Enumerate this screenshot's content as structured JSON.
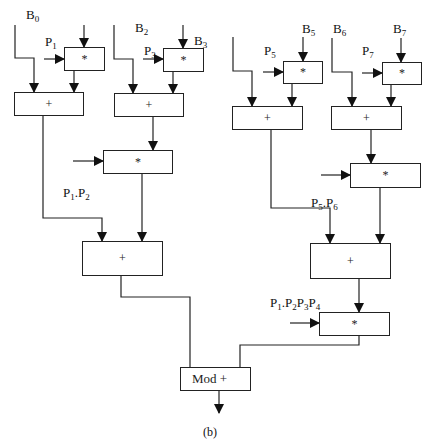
{
  "diagram": {
    "caption": "(b)",
    "operators": {
      "mul": "*",
      "add": "+",
      "mod_add": "Mod +"
    },
    "inputs": {
      "b0": {
        "base": "B",
        "sub": "0"
      },
      "b2": {
        "base": "B",
        "sub": "2"
      },
      "b3": {
        "base": "B",
        "sub": "3"
      },
      "b5": {
        "base": "B",
        "sub": "5"
      },
      "b6": {
        "base": "B",
        "sub": "6"
      },
      "b7": {
        "base": "B",
        "sub": "7"
      },
      "p1": {
        "base": "P",
        "sub": "1"
      },
      "p3": {
        "base": "P",
        "sub": "3"
      },
      "p5": {
        "base": "P",
        "sub": "5"
      },
      "p7": {
        "base": "P",
        "sub": "7"
      }
    },
    "products": {
      "p1p2": {
        "a": "P",
        "a_sub": "1",
        "sep": ".",
        "b": "P",
        "b_sub": "2"
      },
      "p5p6": {
        "a": "P",
        "a_sub": "5",
        "sep": ".",
        "b": "P",
        "b_sub": "6"
      },
      "p1p2p3p4": {
        "a": "P",
        "a_sub": "1",
        "sep": ".",
        "b": "P",
        "b_sub": "2",
        "c": "P",
        "c_sub": "3",
        "d": "P",
        "d_sub": "4"
      }
    },
    "colors": {
      "line": "#222222",
      "background": "#ffffff"
    }
  }
}
